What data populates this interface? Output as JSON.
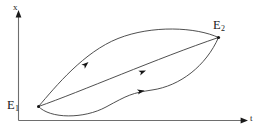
{
  "figure": {
    "background_color": "#ffffff",
    "line_color": "#3b3b3b",
    "axis_color": "#6e6e6e",
    "label_color": "#1a1a1a",
    "width": 270,
    "height": 134
  },
  "axes": {
    "vertical": {
      "label": "x",
      "label_base": "x",
      "arrow": "up-arrow-icon"
    },
    "horizontal": {
      "label": "t",
      "label_base": "t",
      "arrow": "right-arrow-icon"
    }
  },
  "points": [
    {
      "id": "E1",
      "base": "E",
      "subscript": "1",
      "role": "start-equilibrium"
    },
    {
      "id": "E2",
      "base": "E",
      "subscript": "2",
      "role": "end-equilibrium"
    }
  ],
  "trajectories": [
    {
      "name": "upper-trajectory",
      "from": "E1",
      "to": "E2",
      "shape": "arc-above",
      "direction": "E1-to-E2",
      "arrow_count": 1
    },
    {
      "name": "middle-trajectory",
      "from": "E1",
      "to": "E2",
      "shape": "near-straight",
      "direction": "E1-to-E2",
      "arrow_count": 1
    },
    {
      "name": "lower-trajectory",
      "from": "E1",
      "to": "E2",
      "shape": "s-curve-below",
      "direction": "E1-to-E2",
      "arrow_count": 1
    }
  ]
}
